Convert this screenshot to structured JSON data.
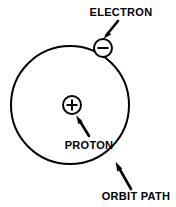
{
  "diagram": {
    "background_color": "#ffffff",
    "line_color": "#000000",
    "labels": {
      "electron": "ELECTRON",
      "proton": "PROTON",
      "orbit_path": "ORBIT PATH"
    },
    "symbols": {
      "electron_charge": "minus",
      "proton_charge": "plus"
    },
    "geometry": {
      "orbit_center_x": 70,
      "orbit_center_y": 105,
      "orbit_radius": 59,
      "orbit_stroke_width": 2,
      "electron_center_x": 103,
      "electron_center_y": 48,
      "electron_radius": 9,
      "proton_center_x": 72,
      "proton_center_y": 105,
      "proton_radius": 9
    },
    "annotations": [
      {
        "name": "electron",
        "label": "ELECTRON",
        "label_x": 121,
        "label_y": 16,
        "anchor": "middle",
        "arrow_from_x": 118,
        "arrow_from_y": 21,
        "arrow_to_x": 104,
        "arrow_to_y": 38
      },
      {
        "name": "proton",
        "label": "PROTON",
        "label_x": 89,
        "label_y": 149,
        "anchor": "middle",
        "arrow_from_x": 89,
        "arrow_from_y": 136,
        "arrow_to_x": 76,
        "arrow_to_y": 115
      },
      {
        "name": "orbit-path",
        "label": "ORBIT PATH",
        "label_x": 136,
        "label_y": 200,
        "anchor": "middle",
        "arrow_from_x": 131,
        "arrow_from_y": 189,
        "arrow_to_x": 115,
        "arrow_to_y": 161
      }
    ]
  }
}
